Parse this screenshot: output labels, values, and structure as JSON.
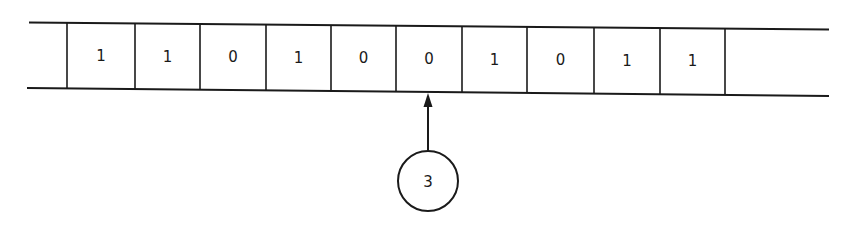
{
  "diagram": {
    "type": "turing-machine-tape",
    "tape": {
      "cells": [
        "1",
        "1",
        "0",
        "1",
        "0",
        "0",
        "1",
        "0",
        "1",
        "1"
      ],
      "trailing_blank_cells": 1,
      "head_position_index": 5
    },
    "head": {
      "state_label": "3"
    },
    "colors": {
      "line": "#1a1a1a",
      "background": "#ffffff"
    }
  }
}
